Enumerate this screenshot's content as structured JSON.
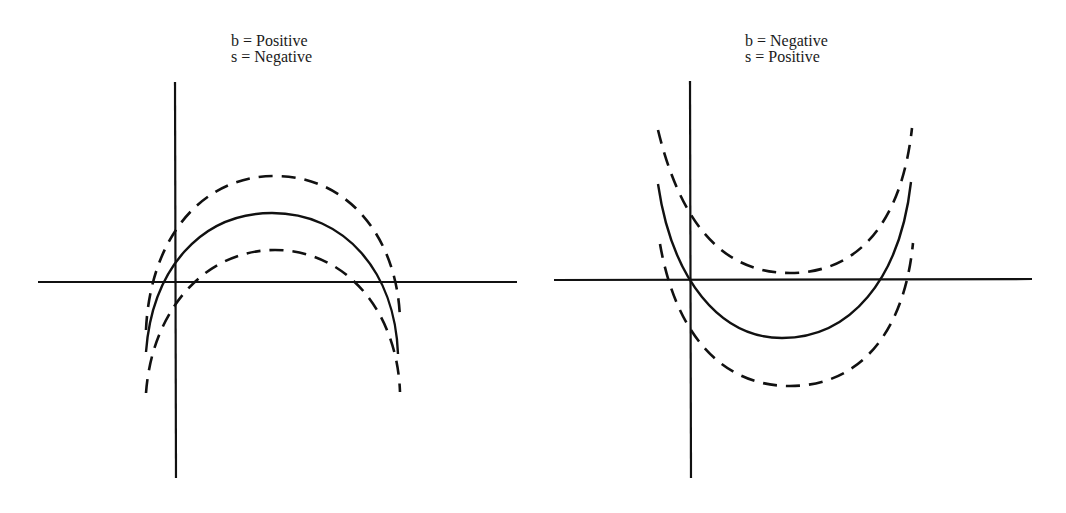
{
  "panels": [
    {
      "id": "left",
      "label_line1": "b = Positive",
      "label_line2": "s = Negative",
      "shape": "downward-opening parabola (concave down) with parallel dashed bounds",
      "curves": [
        {
          "name": "upper-dashed",
          "style": "dashed"
        },
        {
          "name": "center-solid",
          "style": "solid"
        },
        {
          "name": "lower-dashed",
          "style": "dashed"
        }
      ]
    },
    {
      "id": "right",
      "label_line1": "b = Negative",
      "label_line2": "s = Positive",
      "shape": "upward-opening parabola (concave up) with parallel dashed bounds",
      "curves": [
        {
          "name": "upper-dashed",
          "style": "dashed"
        },
        {
          "name": "center-solid",
          "style": "solid"
        },
        {
          "name": "lower-dashed",
          "style": "dashed"
        }
      ]
    }
  ],
  "colors": {
    "stroke": "#111111",
    "background": "#ffffff"
  }
}
